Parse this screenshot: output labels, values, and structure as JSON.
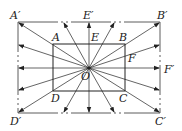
{
  "diagram": {
    "center": {
      "label": "O",
      "x": 89,
      "y": 68
    },
    "inner_rect": {
      "x1": 53,
      "y1": 44,
      "x2": 125,
      "y2": 91
    },
    "outer_rect": {
      "x1": 18,
      "y1": 22,
      "x2": 160,
      "y2": 113
    },
    "labels": {
      "A": "A",
      "B": "B",
      "C": "C",
      "D": "D",
      "E": "E",
      "F": "F",
      "O": "O",
      "A_prime": "A′",
      "B_prime": "B′",
      "C_prime": "C′",
      "D_prime": "D′",
      "E_prime": "E′",
      "F_prime": "F′"
    },
    "stroke_color": "#222222"
  }
}
